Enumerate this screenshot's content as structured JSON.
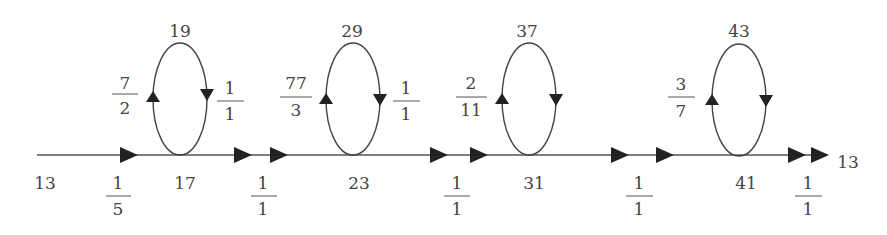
{
  "diagram": {
    "type": "flow-graph",
    "main_line": {
      "start_label": "13",
      "end_label": "13"
    },
    "nodes": [
      {
        "id": "17",
        "label": "17",
        "loop_top": "19",
        "loop_left_weight": {
          "num": "7",
          "den": "2"
        },
        "loop_right_weight": {
          "num": "1",
          "den": "1"
        }
      },
      {
        "id": "23",
        "label": "23",
        "loop_top": "29",
        "loop_left_weight": {
          "num": "77",
          "den": "3"
        },
        "loop_right_weight": {
          "num": "1",
          "den": "1"
        }
      },
      {
        "id": "31",
        "label": "31",
        "loop_top": "37",
        "loop_left_weight": {
          "num": "2",
          "den": "11"
        }
      },
      {
        "id": "41",
        "label": "41",
        "loop_top": "43",
        "loop_left_weight": {
          "num": "3",
          "den": "7"
        }
      }
    ],
    "edge_weights": [
      {
        "num": "1",
        "den": "5"
      },
      {
        "num": "1",
        "den": "1"
      },
      {
        "num": "1",
        "den": "1"
      },
      {
        "num": "1",
        "den": "1"
      },
      {
        "num": "1",
        "den": "1"
      }
    ]
  }
}
